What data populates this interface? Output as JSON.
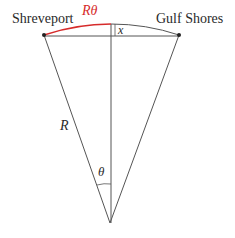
{
  "diagram": {
    "labels": {
      "left_city": "Shreveport",
      "right_city": "Gulf Shores",
      "arc_length": "Rθ",
      "radius": "R",
      "angle": "θ",
      "height": "x"
    },
    "colors": {
      "arc_highlight": "#d62b2b",
      "lines": "#555555",
      "text": "#2a2a2a"
    }
  }
}
